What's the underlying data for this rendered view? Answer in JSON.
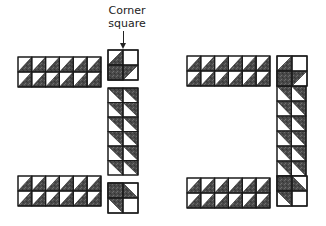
{
  "caption": {
    "line1": "Corner",
    "line2": "square"
  },
  "colors": {
    "dark_fill": "#4a4a4a",
    "light_fill": "#ffffff",
    "stroke": "#1a1a1a"
  },
  "diagrams": [
    {
      "name": "left-separated-layout",
      "strips": [
        {
          "name": "top-horizontal-strip",
          "x": 18,
          "y": 57,
          "cols": 6,
          "rows": 2,
          "cw": 13.83,
          "ch": 15,
          "pattern": "h"
        },
        {
          "name": "vertical-strip",
          "x": 108,
          "y": 88,
          "cols": 2,
          "rows": 6,
          "cw": 15,
          "ch": 14.5,
          "pattern": "v"
        },
        {
          "name": "bottom-horizontal-strip",
          "x": 18,
          "y": 176,
          "cols": 6,
          "rows": 2,
          "cw": 13.83,
          "ch": 15,
          "pattern": "h"
        }
      ],
      "corners": [
        {
          "name": "top-corner-square",
          "x": 108,
          "y": 50,
          "size": 30,
          "pattern": "cornerTop"
        },
        {
          "name": "bottom-corner-square",
          "x": 108,
          "y": 183,
          "size": 30,
          "pattern": "cornerBottom"
        }
      ]
    },
    {
      "name": "right-assembled-layout",
      "strips": [
        {
          "name": "top-horizontal-strip",
          "x": 187,
          "y": 56,
          "cols": 6,
          "rows": 2,
          "cw": 13.83,
          "ch": 15,
          "pattern": "h"
        },
        {
          "name": "vertical-strip",
          "x": 277,
          "y": 86,
          "cols": 2,
          "rows": 6,
          "cw": 14.5,
          "ch": 15,
          "pattern": "v"
        },
        {
          "name": "bottom-horizontal-strip",
          "x": 187,
          "y": 178,
          "cols": 6,
          "rows": 2,
          "cw": 13.83,
          "ch": 15,
          "pattern": "h"
        }
      ],
      "corners": [
        {
          "name": "top-corner-square",
          "x": 277,
          "y": 56,
          "size": 30,
          "pattern": "cornerTop"
        },
        {
          "name": "bottom-corner-square",
          "x": 277,
          "y": 176,
          "size": 30,
          "pattern": "cornerBottom"
        }
      ]
    }
  ]
}
